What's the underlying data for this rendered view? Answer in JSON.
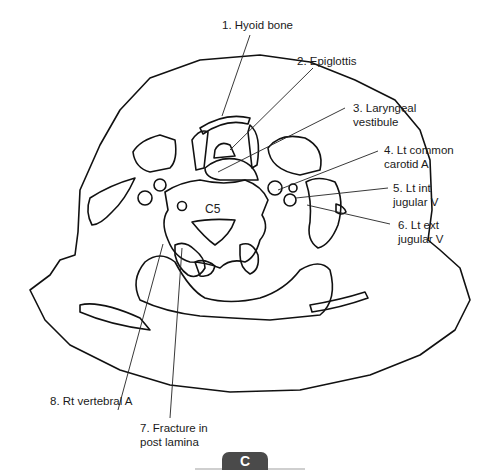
{
  "figure": {
    "panel_label": "C",
    "vertebra_label": "C5",
    "labels": [
      {
        "id": 1,
        "text": "1. Hyoid bone"
      },
      {
        "id": 2,
        "text": "2. Epiglottis"
      },
      {
        "id": 3,
        "text": "3. Laryngeal\nvestibule"
      },
      {
        "id": 4,
        "text": "4. Lt common\ncarotid A"
      },
      {
        "id": 5,
        "text": "5. Lt int\njugular V"
      },
      {
        "id": 6,
        "text": "6. Lt ext\njugular V"
      },
      {
        "id": 7,
        "text": "7. Fracture in\npost lamina"
      },
      {
        "id": 8,
        "text": "8. Rt vertebral A"
      }
    ],
    "line_color": "#111111",
    "tab_color": "#4a4a4a"
  }
}
